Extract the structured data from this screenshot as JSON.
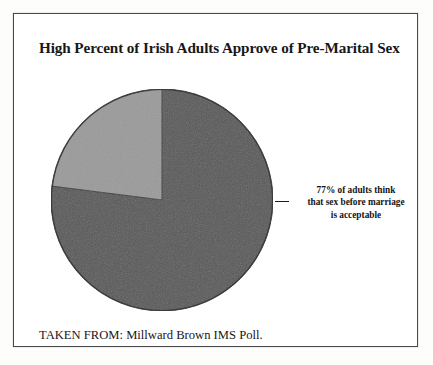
{
  "figure": {
    "title": "High Percent of Irish Adults Approve of Pre-Marital Sex",
    "source": "TAKEN FROM: Millward Brown IMS Poll.",
    "annotation": {
      "line1": "77% of adults think",
      "line2": "that sex before marriage",
      "line3": "is acceptable"
    },
    "colors": {
      "approve_slice": "#585858",
      "other_slice": "#9a9a9a",
      "frame_border": "#4a4a4c",
      "background": "#ffffff",
      "text": "#17171a"
    }
  },
  "chart_data": {
    "type": "pie",
    "title": "High Percent of Irish Adults Approve of Pre-Marital Sex",
    "labels": [
      "Sex before marriage is acceptable",
      "Other"
    ],
    "values": [
      77,
      23
    ],
    "value_unit": "%",
    "colors": [
      "#585858",
      "#9a9a9a"
    ],
    "start_angle_deg": 90,
    "direction": "clockwise",
    "legend": "none",
    "annotations": [
      {
        "text": "77% of adults think that sex before marriage is acceptable",
        "points_to_slice": "Sex before marriage is acceptable",
        "leader": "dash"
      }
    ],
    "source": "Millward Brown IMS Poll."
  }
}
